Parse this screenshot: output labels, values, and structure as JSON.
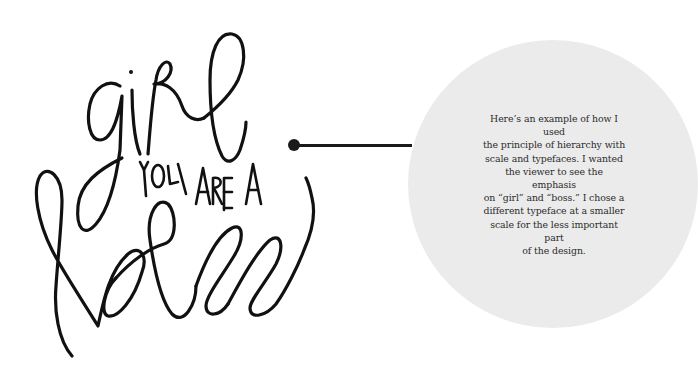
{
  "artwork": {
    "main_word_top": "girl",
    "connector_phrase": "YOU ARE A",
    "main_word_bottom": "boss",
    "ink_color": "#111111"
  },
  "connector": {
    "color": "#1a1a1a"
  },
  "callout": {
    "background_color": "#ebebeb",
    "text_color": "#2b2b2b",
    "lines": [
      "Here’s an example of how I used",
      "the principle of hierarchy with",
      "scale and typefaces. I wanted",
      "the viewer to see the emphasis",
      "on “girl” and “boss.” I chose a",
      "different typeface at a smaller",
      "scale for the less important part",
      "of the design."
    ],
    "text": "Here’s an example of how I used\nthe principle of hierarchy with\nscale and typefaces. I wanted\nthe viewer to see the emphasis\non “girl” and “boss.” I chose a\ndifferent typeface at a smaller\nscale for the less important part\nof the design."
  }
}
